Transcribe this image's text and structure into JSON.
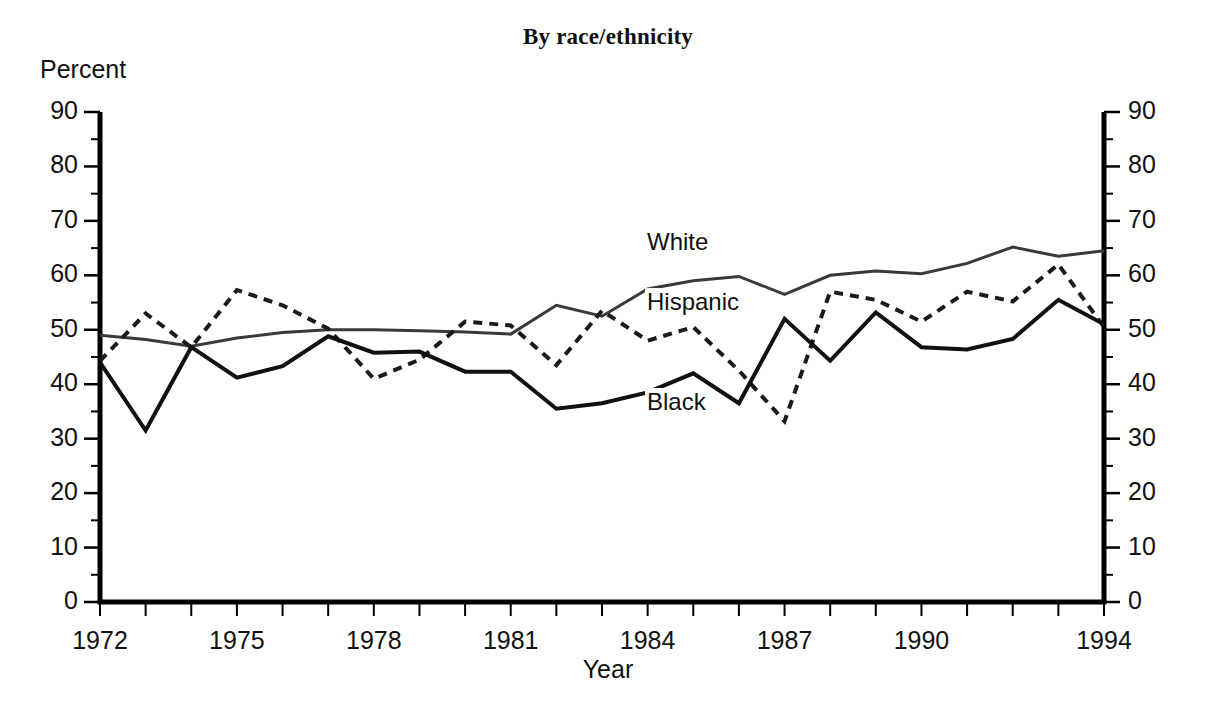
{
  "title": "By race/ethnicity",
  "axis": {
    "y_title": "Percent",
    "x_title": "Year"
  },
  "labels": {
    "white": "White",
    "hispanic": "Hispanic",
    "black": "Black"
  },
  "chart_data": {
    "type": "line",
    "title": "By race/ethnicity",
    "xlabel": "Year",
    "ylabel": "Percent",
    "xlim": [
      1972,
      1994
    ],
    "ylim": [
      0,
      90
    ],
    "yticks": [
      0,
      10,
      20,
      30,
      40,
      50,
      60,
      70,
      80,
      90
    ],
    "ytick_labels": [
      "0",
      "10",
      "20",
      "30",
      "40",
      "50",
      "60",
      "70",
      "80",
      "90"
    ],
    "minor_ytick_step": 5,
    "xticks": [
      1972,
      1973,
      1974,
      1975,
      1976,
      1977,
      1978,
      1979,
      1980,
      1981,
      1982,
      1983,
      1984,
      1985,
      1986,
      1987,
      1988,
      1989,
      1990,
      1991,
      1992,
      1993,
      1994
    ],
    "xtick_labels_shown": [
      "1972",
      "1975",
      "1978",
      "1981",
      "1984",
      "1987",
      "1990",
      "1994"
    ],
    "xtick_label_values": [
      1972,
      1975,
      1978,
      1981,
      1984,
      1987,
      1990,
      1994
    ],
    "grid": false,
    "legend_position": "inline-annotations",
    "x": [
      1972,
      1973,
      1974,
      1975,
      1976,
      1977,
      1978,
      1979,
      1980,
      1981,
      1982,
      1983,
      1984,
      1985,
      1986,
      1987,
      1988,
      1989,
      1990,
      1991,
      1992,
      1993,
      1994
    ],
    "series": [
      {
        "name": "White",
        "style": "solid",
        "color": "#3a3a3a",
        "width": 3,
        "values": [
          49.0,
          48.2,
          47.0,
          48.5,
          49.5,
          50.0,
          50.0,
          49.8,
          49.6,
          49.2,
          54.5,
          52.5,
          57.5,
          59.0,
          59.8,
          56.5,
          60.0,
          60.8,
          60.3,
          62.2,
          65.2,
          63.5,
          64.5
        ]
      },
      {
        "name": "Hispanic",
        "style": "dotted",
        "color": "#1a1a1a",
        "width": 4,
        "values": [
          44.3,
          53.0,
          46.8,
          57.3,
          54.5,
          50.2,
          41.0,
          44.5,
          51.5,
          50.8,
          43.5,
          53.5,
          48.0,
          50.5,
          42.5,
          33.2,
          57.0,
          55.5,
          51.5,
          57.0,
          55.2,
          62.0,
          50.5
        ]
      },
      {
        "name": "Black",
        "style": "solid",
        "color": "#111111",
        "width": 4,
        "values": [
          44.0,
          31.5,
          46.8,
          41.2,
          43.3,
          48.8,
          45.8,
          46.0,
          42.3,
          42.3,
          35.5,
          36.5,
          38.5,
          42.0,
          36.5,
          52.0,
          44.3,
          53.2,
          46.8,
          46.4,
          48.3,
          55.5,
          51.0
        ]
      }
    ]
  }
}
